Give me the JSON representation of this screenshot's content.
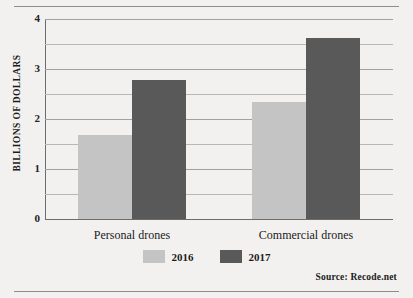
{
  "chart_data": {
    "type": "bar",
    "title": "",
    "xlabel": "",
    "ylabel": "BILLIONS OF DOLLARS",
    "categories": [
      "Personal drones",
      "Commercial drones"
    ],
    "series": [
      {
        "name": "2016",
        "values": [
          1.68,
          2.34
        ],
        "color": "#c4c4c4"
      },
      {
        "name": "2017",
        "values": [
          2.78,
          3.63
        ],
        "color": "#595959"
      }
    ],
    "ylim": [
      0,
      4
    ],
    "yticks": [
      0,
      1,
      2,
      3,
      4
    ],
    "ytick_labels": [
      "0",
      "1",
      "2",
      "3",
      "4"
    ],
    "minor_gridlines": [
      0.5,
      1.5,
      2.5,
      3.5
    ],
    "grid": true,
    "legend_position": "bottom-center",
    "source": "Source:  Recode.net"
  },
  "colors": {
    "background": "#f2f1ef",
    "series_2016": "#c4c4c4",
    "series_2017": "#595959",
    "gridline": "#b9b7b4",
    "axis": "#6f6d6c",
    "rule": "#8d8d8d",
    "text": "#1b1b1b"
  }
}
